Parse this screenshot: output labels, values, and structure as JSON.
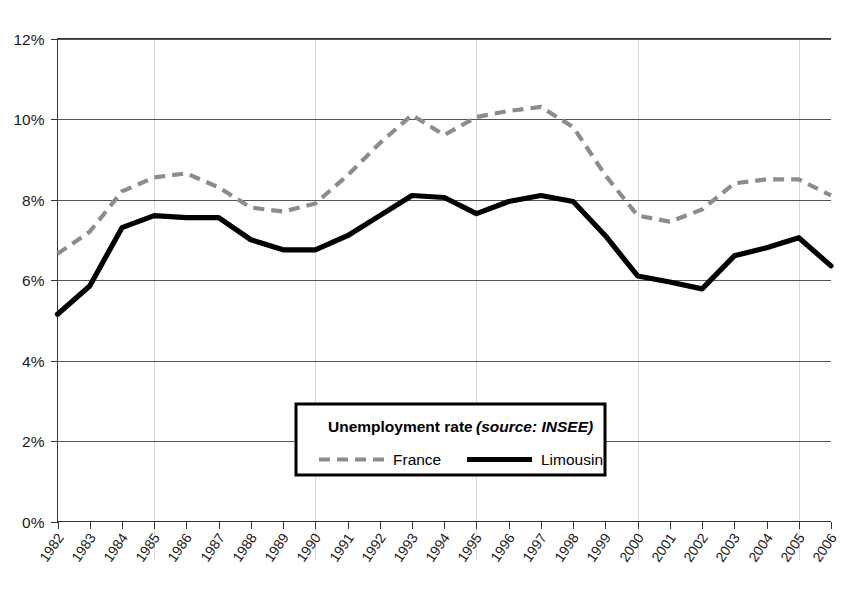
{
  "chart_data": {
    "type": "line",
    "title": "Unemployment rate",
    "subtitle": "(source: INSEE)",
    "xlabel": "",
    "ylabel": "",
    "ylim": [
      0,
      12
    ],
    "ytick_labels": [
      "0%",
      "2%",
      "4%",
      "6%",
      "8%",
      "10%",
      "12%"
    ],
    "ytick_values": [
      0,
      2,
      4,
      6,
      8,
      10,
      12
    ],
    "grid": "horizontal-major-and-faint-vertical",
    "legend_position": "inside-bottom-center",
    "categories": [
      "1982",
      "1983",
      "1984",
      "1985",
      "1986",
      "1987",
      "1988",
      "1989",
      "1990",
      "1991",
      "1992",
      "1993",
      "1994",
      "1995",
      "1996",
      "1997",
      "1998",
      "1999",
      "2000",
      "2001",
      "2002",
      "2003",
      "2004",
      "2005",
      "2006"
    ],
    "x": [
      1982,
      1983,
      1984,
      1985,
      1986,
      1987,
      1988,
      1989,
      1990,
      1991,
      1992,
      1993,
      1994,
      1995,
      1996,
      1997,
      1998,
      1999,
      2000,
      2001,
      2002,
      2003,
      2004,
      2005,
      2006
    ],
    "vertical_gridline_years": [
      1985,
      1990,
      1995,
      2000,
      2005
    ],
    "series": [
      {
        "name": "France",
        "style": "dashed",
        "color": "#8c8c8c",
        "values": [
          6.65,
          7.2,
          8.2,
          8.55,
          8.65,
          8.3,
          7.8,
          7.7,
          7.9,
          8.6,
          9.4,
          10.1,
          9.6,
          10.05,
          10.2,
          10.3,
          9.8,
          8.6,
          7.6,
          7.45,
          7.75,
          8.4,
          8.5,
          8.5,
          8.1
        ]
      },
      {
        "name": "Limousin",
        "style": "solid",
        "color": "#000000",
        "values": [
          5.15,
          5.85,
          7.3,
          7.6,
          7.55,
          7.55,
          7.0,
          6.75,
          6.75,
          7.1,
          7.6,
          8.1,
          8.05,
          7.65,
          7.95,
          8.1,
          7.95,
          7.1,
          6.1,
          5.95,
          5.78,
          6.6,
          6.8,
          7.05,
          6.35
        ]
      }
    ]
  },
  "legend": {
    "title": "Unemployment rate",
    "source": "(source: INSEE)",
    "entries": [
      {
        "label": "France",
        "swatch": "dashed-gray-line"
      },
      {
        "label": "Limousin",
        "swatch": "solid-black-line"
      }
    ]
  },
  "axes": {
    "y_tick_labels": [
      "12%",
      "10%",
      "8%",
      "6%",
      "4%",
      "2%",
      "0%"
    ],
    "x_tick_labels": [
      "1982",
      "1983",
      "1984",
      "1985",
      "1986",
      "1987",
      "1988",
      "1989",
      "1990",
      "1991",
      "1992",
      "1993",
      "1994",
      "1995",
      "1996",
      "1997",
      "1998",
      "1999",
      "2000",
      "2001",
      "2002",
      "2003",
      "2004",
      "2005",
      "2006"
    ]
  },
  "colors": {
    "france_line": "#8c8c8c",
    "limousin_line": "#000000",
    "gridline": "#555555",
    "faint_gridline": "#d9d9d9",
    "background": "#ffffff"
  }
}
